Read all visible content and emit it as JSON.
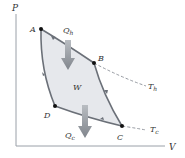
{
  "diagram": {
    "axes": {
      "y_label": "P",
      "x_label": "V"
    },
    "points": [
      {
        "id": "A",
        "label": "A"
      },
      {
        "id": "B",
        "label": "B"
      },
      {
        "id": "C",
        "label": "C"
      },
      {
        "id": "D",
        "label": "D"
      }
    ],
    "isotherms": [
      {
        "id": "hot",
        "label": "T",
        "subscript": "h"
      },
      {
        "id": "cold",
        "label": "T",
        "subscript": "c"
      }
    ],
    "heat_in": {
      "label": "Q",
      "subscript": "h"
    },
    "heat_out": {
      "label": "Q",
      "subscript": "c"
    },
    "work": {
      "label": "W"
    },
    "colors": {
      "cycle_stroke": "#6b7078",
      "cycle_fill": "#e6e8ec",
      "arrow_fill": "#8f949b",
      "axis": "#9aa0a8",
      "dashed": "#8a8f96",
      "point": "#111111",
      "text": "#333333"
    }
  }
}
